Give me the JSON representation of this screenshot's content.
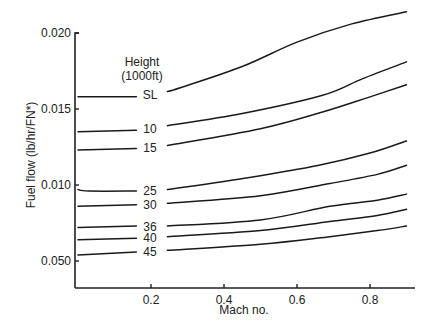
{
  "chart_data": {
    "type": "line",
    "title": "",
    "xlabel": "Mach no.",
    "ylabel": "Fuel flow (lb/hr/FN*)",
    "xlim": [
      0,
      0.92
    ],
    "ylim": [
      0.0032,
      0.0204
    ],
    "x_ticks": [
      {
        "value": 0.2,
        "label": "0.2"
      },
      {
        "value": 0.4,
        "label": "0.4"
      },
      {
        "value": 0.6,
        "label": "0.6"
      },
      {
        "value": 0.8,
        "label": "0.8"
      }
    ],
    "y_ticks": [
      {
        "value": 0.02,
        "label": "0.020"
      },
      {
        "value": 0.015,
        "label": "0.015"
      },
      {
        "value": 0.01,
        "label": "0.010"
      },
      {
        "value": 0.005,
        "label": "0.050"
      }
    ],
    "grid": false,
    "legend_title": [
      "Height",
      "(1000ft)"
    ],
    "series": [
      {
        "name": "SL",
        "left": [
          [
            0.0,
            0.0158
          ],
          [
            0.16,
            0.0158
          ]
        ],
        "right": [
          [
            0.245,
            0.01615
          ],
          [
            0.28,
            0.0164
          ],
          [
            0.45,
            0.0178
          ],
          [
            0.6,
            0.0194
          ],
          [
            0.75,
            0.0206
          ],
          [
            0.9,
            0.0214
          ]
        ]
      },
      {
        "name": "10",
        "left": [
          [
            0.0,
            0.0135
          ],
          [
            0.16,
            0.0136
          ]
        ],
        "right": [
          [
            0.245,
            0.0139
          ],
          [
            0.45,
            0.0147
          ],
          [
            0.67,
            0.0159
          ],
          [
            0.78,
            0.017
          ],
          [
            0.9,
            0.0181
          ]
        ]
      },
      {
        "name": "15",
        "left": [
          [
            0.0,
            0.0123
          ],
          [
            0.16,
            0.0124
          ]
        ],
        "right": [
          [
            0.245,
            0.0126
          ],
          [
            0.5,
            0.0137
          ],
          [
            0.67,
            0.0148
          ],
          [
            0.8,
            0.0158
          ],
          [
            0.9,
            0.0166
          ]
        ]
      },
      {
        "name": "25",
        "left": [
          [
            0.0,
            0.0097
          ],
          [
            0.03,
            0.0096
          ],
          [
            0.16,
            0.0096
          ]
        ],
        "right": [
          [
            0.245,
            0.0097
          ],
          [
            0.47,
            0.0105
          ],
          [
            0.66,
            0.0113
          ],
          [
            0.8,
            0.0121
          ],
          [
            0.9,
            0.0129
          ]
        ]
      },
      {
        "name": "30",
        "left": [
          [
            0.0,
            0.0086
          ],
          [
            0.16,
            0.0087
          ]
        ],
        "right": [
          [
            0.245,
            0.0088
          ],
          [
            0.5,
            0.0093
          ],
          [
            0.69,
            0.0101
          ],
          [
            0.82,
            0.0107
          ],
          [
            0.9,
            0.0113
          ]
        ]
      },
      {
        "name": "36",
        "left": [
          [
            0.0,
            0.0072
          ],
          [
            0.16,
            0.0073
          ]
        ],
        "right": [
          [
            0.245,
            0.0073
          ],
          [
            0.5,
            0.0077
          ],
          [
            0.69,
            0.0086
          ],
          [
            0.82,
            0.009
          ],
          [
            0.9,
            0.0094
          ]
        ]
      },
      {
        "name": "40",
        "left": [
          [
            0.0,
            0.0064
          ],
          [
            0.16,
            0.0065
          ]
        ],
        "right": [
          [
            0.245,
            0.0066
          ],
          [
            0.5,
            0.007
          ],
          [
            0.69,
            0.0076
          ],
          [
            0.82,
            0.008
          ],
          [
            0.9,
            0.0084
          ]
        ]
      },
      {
        "name": "45",
        "left": [
          [
            0.0,
            0.0054
          ],
          [
            0.16,
            0.0056
          ]
        ],
        "right": [
          [
            0.245,
            0.0057
          ],
          [
            0.5,
            0.0061
          ],
          [
            0.69,
            0.0066
          ],
          [
            0.82,
            0.007
          ],
          [
            0.9,
            0.0073
          ]
        ]
      }
    ]
  }
}
